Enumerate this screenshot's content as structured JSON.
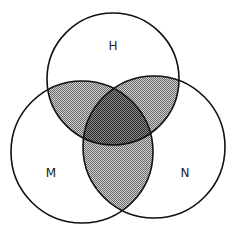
{
  "diagram": {
    "type": "venn-3",
    "sets": [
      {
        "id": "H",
        "label": "H",
        "cx": 113,
        "cy": 79,
        "r": 66,
        "label_x": 113,
        "label_y": 50
      },
      {
        "id": "M",
        "label": "M",
        "cx": 82,
        "cy": 152,
        "r": 71,
        "label_x": 51,
        "label_y": 177
      },
      {
        "id": "N",
        "label": "N",
        "cx": 154,
        "cy": 147,
        "r": 71,
        "label_x": 185,
        "label_y": 177
      }
    ],
    "shading": {
      "pairwise_intersections": "light-gray-dither",
      "triple_intersection": "dark-gray-dither"
    },
    "colors": {
      "outline": "#111111",
      "light_fill": "#a8a8a8",
      "dark_fill": "#5a5a5a",
      "background": "#ffffff"
    }
  }
}
